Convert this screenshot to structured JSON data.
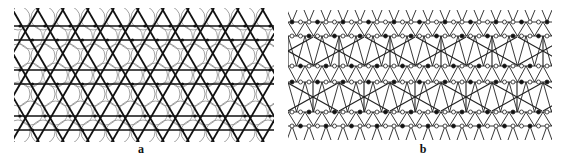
{
  "figure": {
    "panels": [
      {
        "id": "a",
        "label": "a",
        "description": "Kagome-like lattice of bold intersecting lines forming triangles/hexagrams with overlaid thin circles and dark nodes",
        "line_color": "#111111",
        "circle_color": "#8a8a8a",
        "node_color": "#111111",
        "row_lines_y": [
          18,
          32,
          62,
          76,
          108,
          122
        ],
        "period_x": 25,
        "circle_radius": 12
      },
      {
        "id": "b",
        "label": "b",
        "description": "Network of thin lines with alternating filled (black) and open (white) nodes arranged in bands, with larger X-shaped crossings between bands",
        "line_color": "#222222",
        "filled_node_color": "#111111",
        "open_node_color": "#ffffff",
        "row_lines_y": [
          14,
          28,
          58,
          74,
          104,
          118
        ],
        "period_x": 17,
        "node_radius": 2
      }
    ]
  }
}
